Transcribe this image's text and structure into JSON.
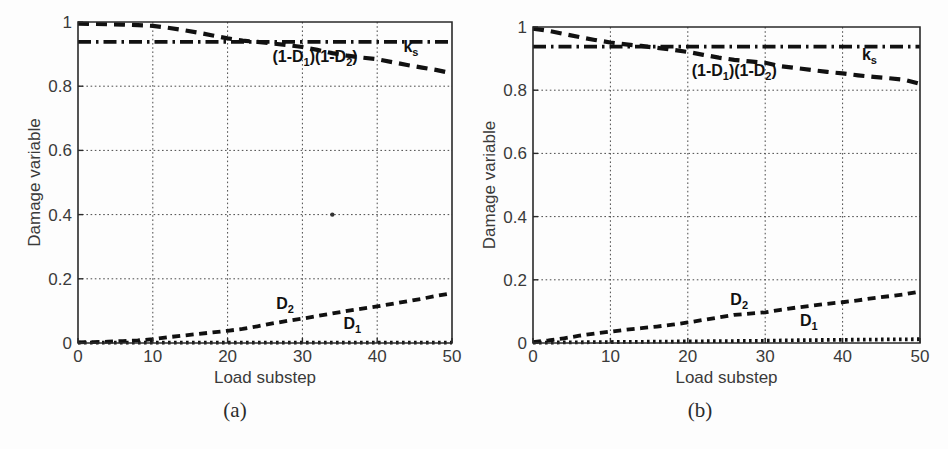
{
  "figure": {
    "background": "#ffffff",
    "line_color": "#111111"
  },
  "panels": [
    {
      "caption": "(a)",
      "chart_index": 0
    },
    {
      "caption": "(b)",
      "chart_index": 1
    }
  ],
  "chart_data": [
    {
      "type": "line",
      "title": "",
      "xlabel": "Load substep",
      "ylabel": "Damage variable",
      "xlim": [
        0,
        50
      ],
      "ylim": [
        0,
        1
      ],
      "xticks": [
        0,
        10,
        20,
        30,
        40,
        50
      ],
      "xticklabels": [
        "0",
        "10",
        "20",
        "30",
        "40",
        "50"
      ],
      "yticks": [
        0,
        0.2,
        0.4,
        0.6,
        0.8,
        1
      ],
      "yticklabels": [
        "0",
        "0.2",
        "0.4",
        "0.6",
        "0.8",
        "1"
      ],
      "grid": true,
      "legend_position": "inline-annotations",
      "annotations": [
        {
          "text": "(1-D",
          "sub": "1",
          "text2": ")(1-D",
          "sub2": "2",
          "text3": ")",
          "x": 26,
          "y": 0.875,
          "name": "product-label"
        },
        {
          "text": "k",
          "sub": "s",
          "x": 43.5,
          "y": 0.905,
          "name": "ks-label"
        },
        {
          "text": "D",
          "sub": "2",
          "x": 26.5,
          "y": 0.105,
          "name": "d2-label"
        },
        {
          "text": "D",
          "sub": "1",
          "x": 35.5,
          "y": 0.045,
          "name": "d1-label"
        }
      ],
      "series": [
        {
          "name": "(1-D1)(1-D2)",
          "style": "dashed",
          "dasharray": "11 7",
          "width": 4.2,
          "x": [
            0,
            2,
            4,
            6,
            8,
            10,
            12,
            14,
            16,
            18,
            20,
            22,
            24,
            26,
            28,
            30,
            32,
            34,
            36,
            38,
            40,
            42,
            44,
            46,
            48,
            50
          ],
          "values": [
            0.995,
            0.994,
            0.993,
            0.992,
            0.99,
            0.988,
            0.982,
            0.975,
            0.967,
            0.958,
            0.949,
            0.942,
            0.938,
            0.933,
            0.928,
            0.922,
            0.913,
            0.903,
            0.895,
            0.889,
            0.884,
            0.875,
            0.866,
            0.858,
            0.85,
            0.84
          ]
        },
        {
          "name": "k_s",
          "style": "dashdot",
          "dasharray": "13 5 2.5 5",
          "width": 3.6,
          "x": [
            0,
            10,
            20,
            30,
            40,
            50
          ],
          "values": [
            0.938,
            0.938,
            0.938,
            0.938,
            0.938,
            0.938
          ]
        },
        {
          "name": "D2",
          "style": "dashed",
          "dasharray": "8 5.5",
          "width": 3.8,
          "x": [
            0,
            2,
            4,
            6,
            8,
            10,
            12,
            14,
            16,
            18,
            20,
            22,
            24,
            26,
            28,
            30,
            32,
            34,
            36,
            38,
            40,
            42,
            44,
            46,
            48,
            50
          ],
          "values": [
            0.002,
            0.003,
            0.004,
            0.006,
            0.008,
            0.012,
            0.018,
            0.023,
            0.028,
            0.033,
            0.038,
            0.044,
            0.052,
            0.061,
            0.069,
            0.076,
            0.084,
            0.092,
            0.1,
            0.107,
            0.114,
            0.122,
            0.13,
            0.138,
            0.147,
            0.155
          ]
        },
        {
          "name": "D1",
          "style": "dotted",
          "dasharray": "2.6 3.4",
          "width": 3.8,
          "x": [
            0,
            10,
            20,
            30,
            40,
            50
          ],
          "values": [
            0.001,
            0.001,
            0.001,
            0.001,
            0.001,
            0.001
          ]
        }
      ],
      "specks": [
        {
          "x": 34,
          "y": 0.4
        }
      ]
    },
    {
      "type": "line",
      "title": "",
      "xlabel": "Load substep",
      "ylabel": "Damage variable",
      "xlim": [
        0,
        50
      ],
      "ylim": [
        0,
        1
      ],
      "xticks": [
        0,
        10,
        20,
        30,
        40,
        50
      ],
      "xticklabels": [
        "0",
        "10",
        "20",
        "30",
        "40",
        "50"
      ],
      "yticks": [
        0,
        0.2,
        0.4,
        0.6,
        0.8,
        1
      ],
      "yticklabels": [
        "0",
        "0.2",
        "0.4",
        "0.6",
        "0.8",
        "1"
      ],
      "grid": true,
      "legend_position": "inline-annotations",
      "annotations": [
        {
          "text": "(1-D",
          "sub": "1",
          "text2": ")(1-D",
          "sub2": "2",
          "text3": ")",
          "x": 20.5,
          "y": 0.845,
          "name": "product-label"
        },
        {
          "text": "k",
          "sub": "s",
          "x": 42.5,
          "y": 0.895,
          "name": "ks-label"
        },
        {
          "text": "D",
          "sub": "2",
          "x": 25.5,
          "y": 0.12,
          "name": "d2-label"
        },
        {
          "text": "D",
          "sub": "1",
          "x": 34.5,
          "y": 0.055,
          "name": "d1-label"
        }
      ],
      "series": [
        {
          "name": "(1-D1)(1-D2)",
          "style": "dashed",
          "dasharray": "11 7",
          "width": 4.2,
          "x": [
            0,
            2,
            4,
            6,
            8,
            10,
            12,
            14,
            16,
            18,
            20,
            22,
            24,
            26,
            28,
            30,
            32,
            34,
            36,
            38,
            40,
            42,
            44,
            46,
            48,
            50
          ],
          "values": [
            0.995,
            0.988,
            0.978,
            0.968,
            0.959,
            0.951,
            0.945,
            0.94,
            0.934,
            0.928,
            0.921,
            0.912,
            0.903,
            0.896,
            0.891,
            0.887,
            0.876,
            0.87,
            0.864,
            0.858,
            0.853,
            0.847,
            0.842,
            0.838,
            0.833,
            0.82
          ]
        },
        {
          "name": "k_s",
          "style": "dashdot",
          "dasharray": "13 5 2.5 5",
          "width": 3.6,
          "x": [
            0,
            10,
            20,
            30,
            40,
            50
          ],
          "values": [
            0.938,
            0.938,
            0.938,
            0.938,
            0.938,
            0.938
          ]
        },
        {
          "name": "D2",
          "style": "dashed",
          "dasharray": "8 5.5",
          "width": 3.8,
          "x": [
            0,
            2,
            4,
            6,
            8,
            10,
            12,
            14,
            16,
            18,
            20,
            22,
            24,
            26,
            28,
            30,
            32,
            34,
            36,
            38,
            40,
            42,
            44,
            46,
            48,
            50
          ],
          "values": [
            0.003,
            0.008,
            0.015,
            0.023,
            0.03,
            0.036,
            0.042,
            0.047,
            0.052,
            0.058,
            0.065,
            0.073,
            0.081,
            0.089,
            0.093,
            0.097,
            0.105,
            0.112,
            0.118,
            0.124,
            0.129,
            0.135,
            0.142,
            0.148,
            0.154,
            0.163
          ]
        },
        {
          "name": "D1",
          "style": "dotted",
          "dasharray": "2.6 3.4",
          "width": 3.8,
          "x": [
            0,
            5,
            10,
            15,
            20,
            25,
            30,
            35,
            40,
            45,
            50
          ],
          "values": [
            0.001,
            0.002,
            0.003,
            0.004,
            0.005,
            0.006,
            0.007,
            0.009,
            0.01,
            0.011,
            0.012
          ]
        }
      ],
      "specks": []
    }
  ]
}
